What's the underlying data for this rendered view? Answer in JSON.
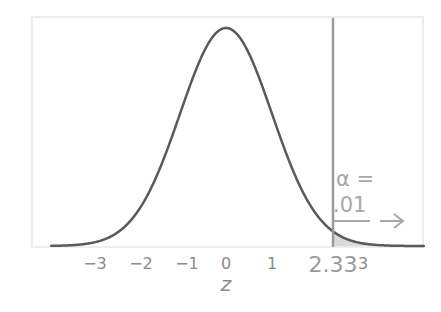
{
  "chart_data": {
    "type": "line",
    "title": "",
    "xlabel": "z",
    "ylabel": "",
    "xlim": [
      -4.1,
      4.4
    ],
    "ylim": [
      0,
      0.42
    ],
    "grid": false,
    "legend": null,
    "series": [
      {
        "name": "Standard normal density",
        "function": "N(0,1) pdf",
        "color": "#5a5a5a"
      }
    ],
    "x_ticks": [
      {
        "value": -3,
        "label": "−3"
      },
      {
        "value": -2,
        "label": "−2"
      },
      {
        "value": -1,
        "label": "−1"
      },
      {
        "value": 0,
        "label": "0"
      },
      {
        "value": 1,
        "label": "1"
      },
      {
        "value": 2.33,
        "label": "2.33"
      },
      {
        "value": 3,
        "label": "3"
      }
    ],
    "critical_line": {
      "x": 2.33,
      "color": "#9a9a9a"
    },
    "shaded_region": {
      "from": 2.33,
      "to": 4.4,
      "color": "#d8d8d8"
    },
    "annotations": [
      {
        "text": "α =",
        "x": 2.33,
        "position": "upper-right-tail"
      },
      {
        "text": ".01",
        "x": 2.33,
        "position": "upper-right-tail"
      },
      {
        "text": "→",
        "type": "arrow",
        "direction": "right"
      }
    ]
  },
  "labels": {
    "xlabel": "z",
    "alpha_line1": "α =",
    "alpha_line2": ".01",
    "ticks": [
      "−3",
      "−2",
      "−1",
      "0",
      "1",
      "2.33",
      "3"
    ]
  },
  "colors": {
    "curve": "#5a5a5a",
    "critical_line": "#9a9a9a",
    "frame": "#e6e6e6",
    "text": "#8a8a8a",
    "shade": "#d8d8d8"
  }
}
